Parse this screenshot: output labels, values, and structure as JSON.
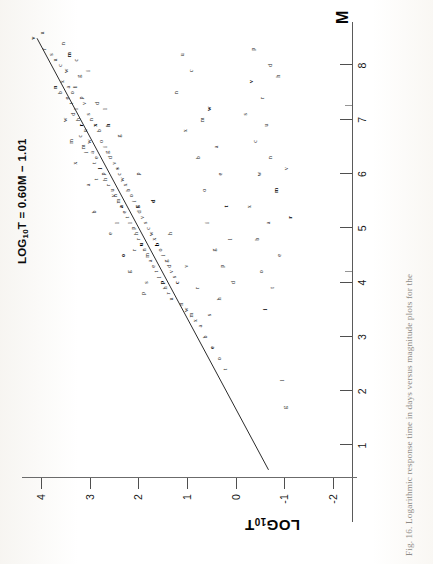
{
  "figure": {
    "caption": "Fig. 16.  Logarithmic response time in days versus magnitude plots for the",
    "equation": "LOG10T = 0.60M − 1.01",
    "equation_prefix": "LOG",
    "equation_sub": "10",
    "equation_rest": "T = 0.60M − 1.01"
  },
  "chart_data": {
    "type": "scatter",
    "title": "",
    "xlabel": "M",
    "ylabel": "LOG10T",
    "ylabel_prefix": "LOG",
    "ylabel_sub": "10",
    "ylabel_suffix": "T",
    "xlim": [
      0.4,
      8.8
    ],
    "ylim": [
      -2.4,
      4.4
    ],
    "xticks": [
      1,
      2,
      3,
      4,
      5,
      6,
      7,
      8
    ],
    "xtick_labels": [
      "1",
      "2",
      "3",
      "4",
      "5",
      "6",
      "7",
      "8"
    ],
    "yticks": [
      -2,
      -1,
      0,
      1,
      2,
      3,
      4
    ],
    "ytick_labels": [
      "-2",
      "-1",
      "0",
      "1",
      "2",
      "3",
      "4"
    ],
    "grid": false,
    "legend": "none",
    "fit_line": {
      "label": "LOG10T = 0.60M - 1.01",
      "slope": 0.6,
      "intercept": -1.01,
      "x_start": 0.55,
      "x_end": 8.5,
      "y_start": -0.68,
      "y_end": 4.09
    },
    "marker_style": "small-letter-symbols",
    "series": [
      {
        "name": "main-trend",
        "marker": "letters",
        "points": [
          [
            8.5,
            4.18
          ],
          [
            8.3,
            3.95
          ],
          [
            8.2,
            3.8
          ],
          [
            8.1,
            3.72
          ],
          [
            8.0,
            3.62
          ],
          [
            8.4,
            3.55
          ],
          [
            7.9,
            3.5
          ],
          [
            8.2,
            3.44
          ],
          [
            7.7,
            3.58
          ],
          [
            7.6,
            3.45
          ],
          [
            7.5,
            3.62
          ],
          [
            7.4,
            3.48
          ],
          [
            7.5,
            3.38
          ],
          [
            7.3,
            3.4
          ],
          [
            7.6,
            3.3
          ],
          [
            7.2,
            3.28
          ],
          [
            7.8,
            3.22
          ],
          [
            7.4,
            3.18
          ],
          [
            7.1,
            3.35
          ],
          [
            7.0,
            3.25
          ],
          [
            7.3,
            3.12
          ],
          [
            6.9,
            3.18
          ],
          [
            7.1,
            3.05
          ],
          [
            6.8,
            3.1
          ],
          [
            6.7,
            3.2
          ],
          [
            7.0,
            2.98
          ],
          [
            6.6,
            3.02
          ],
          [
            6.5,
            3.15
          ],
          [
            6.9,
            2.9
          ],
          [
            6.4,
            2.95
          ],
          [
            6.8,
            2.82
          ],
          [
            6.3,
            2.88
          ],
          [
            6.6,
            2.78
          ],
          [
            6.2,
            2.92
          ],
          [
            6.5,
            2.7
          ],
          [
            6.1,
            2.8
          ],
          [
            6.4,
            2.64
          ],
          [
            6.0,
            2.74
          ],
          [
            6.3,
            2.58
          ],
          [
            5.9,
            2.7
          ],
          [
            6.2,
            2.5
          ],
          [
            5.8,
            2.62
          ],
          [
            6.1,
            2.44
          ],
          [
            5.7,
            2.55
          ],
          [
            6.0,
            2.4
          ],
          [
            5.6,
            2.48
          ],
          [
            5.9,
            2.34
          ],
          [
            5.5,
            2.42
          ],
          [
            5.8,
            2.28
          ],
          [
            5.4,
            2.36
          ],
          [
            5.7,
            2.22
          ],
          [
            5.3,
            2.3
          ],
          [
            5.6,
            2.16
          ],
          [
            5.2,
            2.24
          ],
          [
            5.5,
            2.1
          ],
          [
            5.1,
            2.18
          ],
          [
            5.4,
            2.04
          ],
          [
            5.0,
            2.12
          ],
          [
            5.3,
            1.98
          ],
          [
            4.9,
            2.06
          ],
          [
            5.2,
            1.92
          ],
          [
            4.8,
            2.0
          ],
          [
            5.1,
            1.86
          ],
          [
            4.7,
            1.94
          ],
          [
            5.0,
            1.8
          ],
          [
            4.6,
            1.88
          ],
          [
            4.9,
            1.74
          ],
          [
            4.5,
            1.82
          ],
          [
            4.8,
            1.68
          ],
          [
            4.4,
            1.76
          ],
          [
            4.7,
            1.62
          ],
          [
            4.3,
            1.7
          ],
          [
            4.6,
            1.56
          ],
          [
            4.2,
            1.64
          ],
          [
            4.5,
            1.5
          ],
          [
            4.1,
            1.58
          ],
          [
            4.4,
            1.44
          ],
          [
            4.0,
            1.52
          ],
          [
            4.3,
            1.38
          ],
          [
            3.9,
            1.46
          ],
          [
            4.2,
            1.32
          ],
          [
            3.8,
            1.4
          ],
          [
            4.1,
            1.26
          ],
          [
            3.7,
            1.34
          ],
          [
            4.0,
            1.2
          ],
          [
            3.6,
            1.12
          ],
          [
            3.5,
            1.02
          ],
          [
            3.4,
            0.92
          ],
          [
            3.3,
            0.84
          ],
          [
            3.2,
            0.74
          ],
          [
            3.0,
            0.62
          ],
          [
            2.8,
            0.48
          ],
          [
            2.6,
            0.35
          ],
          [
            2.4,
            0.22
          ],
          [
            7.9,
            3.05
          ],
          [
            7.2,
            2.68
          ],
          [
            6.7,
            2.4
          ],
          [
            6.0,
            2.0
          ],
          [
            5.5,
            1.7
          ],
          [
            4.9,
            1.36
          ],
          [
            4.3,
            1.02
          ],
          [
            3.9,
            0.8
          ],
          [
            3.4,
            0.55
          ]
        ]
      },
      {
        "name": "upper-scatter",
        "marker": "letters",
        "points": [
          [
            8.6,
            3.98
          ],
          [
            8.1,
            3.28
          ],
          [
            7.6,
            3.72
          ],
          [
            7.0,
            3.52
          ],
          [
            6.6,
            3.4
          ],
          [
            6.2,
            3.3
          ],
          [
            5.8,
            3.05
          ],
          [
            5.3,
            2.92
          ],
          [
            4.9,
            2.58
          ],
          [
            4.5,
            2.32
          ],
          [
            5.9,
            2.88
          ],
          [
            6.4,
            3.08
          ],
          [
            5.1,
            2.44
          ],
          [
            4.2,
            2.2
          ],
          [
            3.8,
            1.9
          ],
          [
            7.3,
            2.86
          ],
          [
            6.9,
            2.62
          ],
          [
            5.6,
            2.52
          ],
          [
            4.6,
            2.1
          ],
          [
            4.0,
            1.84
          ]
        ]
      },
      {
        "name": "lower-scatter",
        "marker": "letters",
        "points": [
          [
            8.2,
            1.1
          ],
          [
            7.9,
            0.92
          ],
          [
            7.5,
            1.22
          ],
          [
            7.2,
            0.55
          ],
          [
            7.0,
            0.7
          ],
          [
            6.8,
            1.04
          ],
          [
            6.5,
            0.4
          ],
          [
            6.3,
            0.78
          ],
          [
            6.0,
            0.32
          ],
          [
            5.7,
            0.66
          ],
          [
            5.4,
            0.2
          ],
          [
            5.1,
            0.58
          ],
          [
            4.8,
            0.12
          ],
          [
            4.6,
            0.44
          ],
          [
            4.3,
            0.28
          ],
          [
            4.0,
            0.06
          ],
          [
            3.7,
            0.34
          ],
          [
            7.7,
            -0.32
          ],
          [
            7.4,
            -0.55
          ],
          [
            7.1,
            -0.2
          ],
          [
            6.9,
            -0.62
          ],
          [
            6.6,
            -0.4
          ],
          [
            6.3,
            -0.72
          ],
          [
            6.0,
            -0.48
          ],
          [
            5.7,
            -0.84
          ],
          [
            5.4,
            -0.28
          ],
          [
            5.1,
            -0.66
          ],
          [
            4.8,
            -0.44
          ],
          [
            4.5,
            -0.9
          ],
          [
            4.2,
            -0.52
          ],
          [
            3.9,
            -0.75
          ],
          [
            3.5,
            -0.6
          ],
          [
            2.2,
            -0.95
          ],
          [
            1.7,
            -1.02
          ],
          [
            8.3,
            -0.36
          ],
          [
            8.0,
            -0.7
          ],
          [
            7.8,
            -0.88
          ],
          [
            6.1,
            -1.05
          ],
          [
            5.2,
            -1.12
          ]
        ]
      }
    ]
  }
}
